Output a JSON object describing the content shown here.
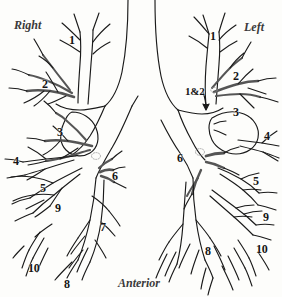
{
  "figure": {
    "background_color": "#fdfdfb",
    "ink_color": "#1a1a1a",
    "shade_color": "#6e6e6e"
  },
  "orientation_labels": [
    {
      "text": "Right",
      "x": 14,
      "y": 18
    },
    {
      "text": "Left",
      "x": 244,
      "y": 20
    },
    {
      "text": "Anterior",
      "x": 118,
      "y": 276
    }
  ],
  "right_lung": {
    "side": "Right",
    "segments": [
      {
        "label": "1",
        "x": 69,
        "y": 34
      },
      {
        "label": "2",
        "x": 42,
        "y": 78
      },
      {
        "label": "3",
        "x": 57,
        "y": 126
      },
      {
        "label": "4",
        "x": 13,
        "y": 155
      },
      {
        "label": "5",
        "x": 40,
        "y": 182
      },
      {
        "label": "9",
        "x": 55,
        "y": 202
      },
      {
        "label": "6",
        "x": 112,
        "y": 170
      },
      {
        "label": "7",
        "x": 100,
        "y": 221
      },
      {
        "label": "10",
        "x": 28,
        "y": 262
      },
      {
        "label": "8",
        "x": 64,
        "y": 278
      }
    ]
  },
  "left_lung": {
    "side": "Left",
    "segments": [
      {
        "label": "1",
        "x": 210,
        "y": 30
      },
      {
        "label": "2",
        "x": 233,
        "y": 70
      },
      {
        "label": "1&2",
        "x": 185,
        "y": 86
      },
      {
        "label": "3",
        "x": 233,
        "y": 106
      },
      {
        "label": "4",
        "x": 264,
        "y": 130
      },
      {
        "label": "6",
        "x": 177,
        "y": 152
      },
      {
        "label": "5",
        "x": 253,
        "y": 175
      },
      {
        "label": "9",
        "x": 263,
        "y": 211
      },
      {
        "label": "8",
        "x": 205,
        "y": 245
      },
      {
        "label": "10",
        "x": 256,
        "y": 243
      }
    ]
  }
}
